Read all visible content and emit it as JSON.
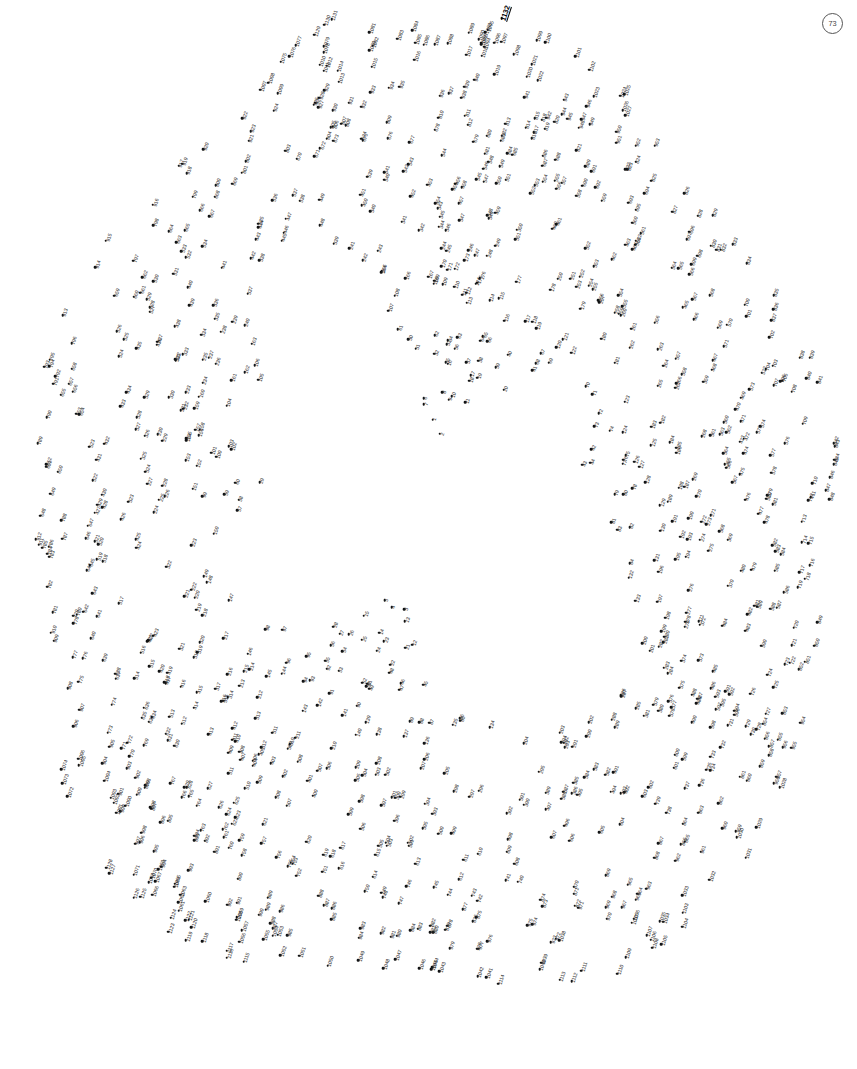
{
  "page": {
    "page_number": "73",
    "width": 857,
    "height": 1069,
    "background_color": "#ffffff",
    "dot_color": "#111111",
    "label_color": "#2a2a2a",
    "final_dot_color": "#000000"
  },
  "puzzle": {
    "type": "connect-the-dots",
    "total_dots": 1132,
    "first_number": 1,
    "last_number": 1132,
    "final_label": "1132",
    "label_rotation_deg": -72,
    "dots_seed": 73,
    "density_note": "Dots form a ring/wreath shaped silhouette with an open interior void",
    "margins": {
      "left": 22,
      "right": 22,
      "top": 18,
      "bottom": 52
    }
  }
}
